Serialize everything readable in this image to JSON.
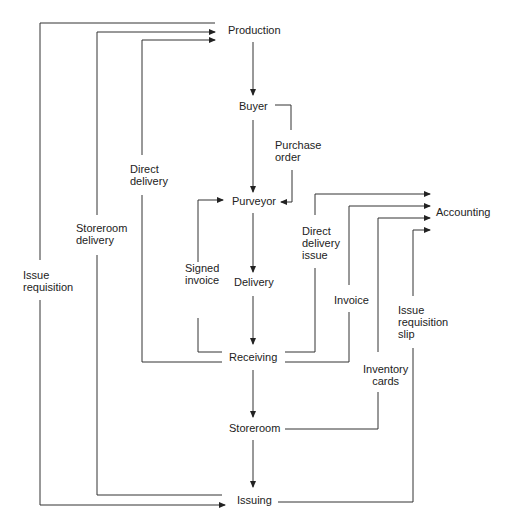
{
  "diagram": {
    "type": "flowchart",
    "nodes": {
      "production": "Production",
      "buyer": "Buyer",
      "purveyor": "Purveyor",
      "delivery": "Delivery",
      "receiving": "Receiving",
      "storeroom": "Storeroom",
      "issuing": "Issuing",
      "accounting": "Accounting"
    },
    "edge_labels": {
      "purchase_order": [
        "Purchase",
        "order"
      ],
      "direct_delivery": [
        "Direct",
        "delivery"
      ],
      "storeroom_delivery": [
        "Storeroom",
        "delivery"
      ],
      "issue_requisition": [
        "Issue",
        "requisition"
      ],
      "signed_invoice": [
        "Signed",
        "invoice"
      ],
      "direct_delivery_issue": [
        "Direct",
        "delivery",
        "issue"
      ],
      "invoice": [
        "Invoice"
      ],
      "issue_requisition_slip": [
        "Issue",
        "requisition",
        "slip"
      ],
      "inventory_cards": [
        "Inventory",
        "cards"
      ]
    },
    "edges": [
      {
        "from": "Production",
        "to": "Buyer"
      },
      {
        "from": "Buyer",
        "to": "Purveyor"
      },
      {
        "from": "Buyer",
        "to": "Purveyor",
        "label": "Purchase order"
      },
      {
        "from": "Purveyor",
        "to": "Delivery"
      },
      {
        "from": "Delivery",
        "to": "Receiving"
      },
      {
        "from": "Receiving",
        "to": "Purveyor",
        "label": "Signed invoice"
      },
      {
        "from": "Receiving",
        "to": "Production",
        "label": "Direct delivery"
      },
      {
        "from": "Receiving",
        "to": "Storeroom"
      },
      {
        "from": "Storeroom",
        "to": "Issuing"
      },
      {
        "from": "Issuing",
        "to": "Production",
        "label": "Storeroom delivery"
      },
      {
        "from": "Production",
        "to": "Issuing",
        "label": "Issue requisition"
      },
      {
        "from": "Receiving",
        "to": "Accounting",
        "label": "Direct delivery issue"
      },
      {
        "from": "Receiving",
        "to": "Accounting",
        "label": "Invoice"
      },
      {
        "from": "Storeroom",
        "to": "Accounting",
        "label": "Inventory cards"
      },
      {
        "from": "Issuing",
        "to": "Accounting",
        "label": "Issue requisition slip"
      }
    ]
  }
}
